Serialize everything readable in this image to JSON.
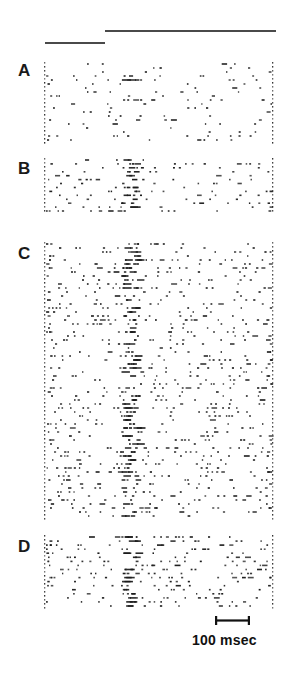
{
  "figure": {
    "type": "raster-plot",
    "width": 287,
    "height": 678,
    "background": "#ffffff",
    "ink_color": "#1a1a1a",
    "bar_color": "#4a4a4a"
  },
  "stimulus_bars": [
    {
      "name": "long-stimulus-bar",
      "x": 105,
      "y": 30,
      "width": 171,
      "height": 2
    },
    {
      "name": "short-stimulus-bar",
      "x": 45,
      "y": 42,
      "width": 60,
      "height": 2
    }
  ],
  "panels": [
    {
      "label": "A",
      "label_x": 18,
      "label_y": 62,
      "top": 62,
      "bottom": 142,
      "rows": 20,
      "density": "sparse"
    },
    {
      "label": "B",
      "label_x": 18,
      "label_y": 160,
      "top": 158,
      "bottom": 213,
      "rows": 14,
      "density": "medium"
    },
    {
      "label": "C",
      "label_x": 18,
      "label_y": 245,
      "top": 242,
      "bottom": 518,
      "rows": 69,
      "density": "dense"
    },
    {
      "label": "D",
      "label_x": 18,
      "label_y": 538,
      "top": 535,
      "bottom": 608,
      "rows": 18,
      "density": "medium"
    }
  ],
  "reference_lines": {
    "left_x": 44,
    "right_x": 272,
    "style": "dotted",
    "dot_spacing": 4
  },
  "response_column": {
    "center_x": 129,
    "half_width": 8
  },
  "scale_bar": {
    "label": "100 msec",
    "x": 215,
    "y": 620,
    "width": 35,
    "cap_height": 9,
    "label_x": 192,
    "label_y": 632
  },
  "chart_data": {
    "type": "scatter",
    "title": "",
    "xlabel": "time",
    "ylabel": "trial",
    "x_scale_bar_msec": 100,
    "x_scale_bar_px": 35,
    "plot_x_range_px": [
      44,
      272
    ],
    "legend": [],
    "annotations": [
      "100 msec"
    ],
    "panel_labels": [
      "A",
      "B",
      "C",
      "D"
    ],
    "series": [
      {
        "name": "A",
        "rows": 20,
        "spike_count_approx": 95
      },
      {
        "name": "B",
        "rows": 14,
        "spike_count_approx": 150
      },
      {
        "name": "C",
        "rows": 69,
        "spike_count_approx": 780
      },
      {
        "name": "D",
        "rows": 18,
        "spike_count_approx": 210
      }
    ]
  }
}
